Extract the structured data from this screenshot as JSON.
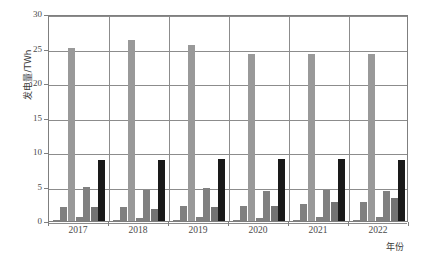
{
  "chart_data": {
    "type": "bar",
    "title": "",
    "subtitle": "",
    "xlabel": "年份",
    "ylabel": "发电量/TWh",
    "categories": [
      "2017",
      "2018",
      "2019",
      "2020",
      "2021",
      "2022"
    ],
    "ylim": [
      0,
      30
    ],
    "yticks": [
      0,
      5,
      10,
      15,
      20,
      25,
      30
    ],
    "ytick_labels": [
      "0",
      "5",
      "10",
      "15",
      "20",
      "25",
      "30"
    ],
    "grid": "horizontal-and-vertical",
    "legend": "none",
    "series": [
      {
        "name": "series-1",
        "color": "#808080",
        "values": [
          0.15,
          0.15,
          0.2,
          0.2,
          0.2,
          0.2
        ]
      },
      {
        "name": "series-2",
        "color": "#808080",
        "values": [
          2.0,
          2.0,
          2.2,
          2.2,
          2.5,
          2.8
        ]
      },
      {
        "name": "series-3",
        "color": "#999999",
        "values": [
          25.1,
          26.2,
          25.5,
          24.2,
          24.2,
          24.2
        ]
      },
      {
        "name": "series-4",
        "color": "#808080",
        "values": [
          0.6,
          0.5,
          0.6,
          0.5,
          0.6,
          0.6
        ]
      },
      {
        "name": "series-5",
        "color": "#808080",
        "values": [
          5.0,
          4.5,
          4.8,
          4.3,
          4.5,
          4.4
        ]
      },
      {
        "name": "series-6",
        "color": "#737373",
        "values": [
          2.0,
          1.8,
          2.0,
          2.2,
          2.8,
          3.3
        ]
      },
      {
        "name": "series-7",
        "color": "#1a1a1a",
        "values": [
          8.9,
          8.9,
          9.0,
          9.0,
          9.0,
          8.8
        ]
      }
    ],
    "colors": {
      "grid": "#8c8c8c",
      "axis": "#7f7f7f",
      "text": "#4a4a4a",
      "background": "#ffffff",
      "bar_light": "#999999",
      "bar_mid": "#808080",
      "bar_dark": "#1a1a1a"
    }
  },
  "axes": {
    "y_title": "发电量/TWh",
    "x_title": "年份"
  }
}
